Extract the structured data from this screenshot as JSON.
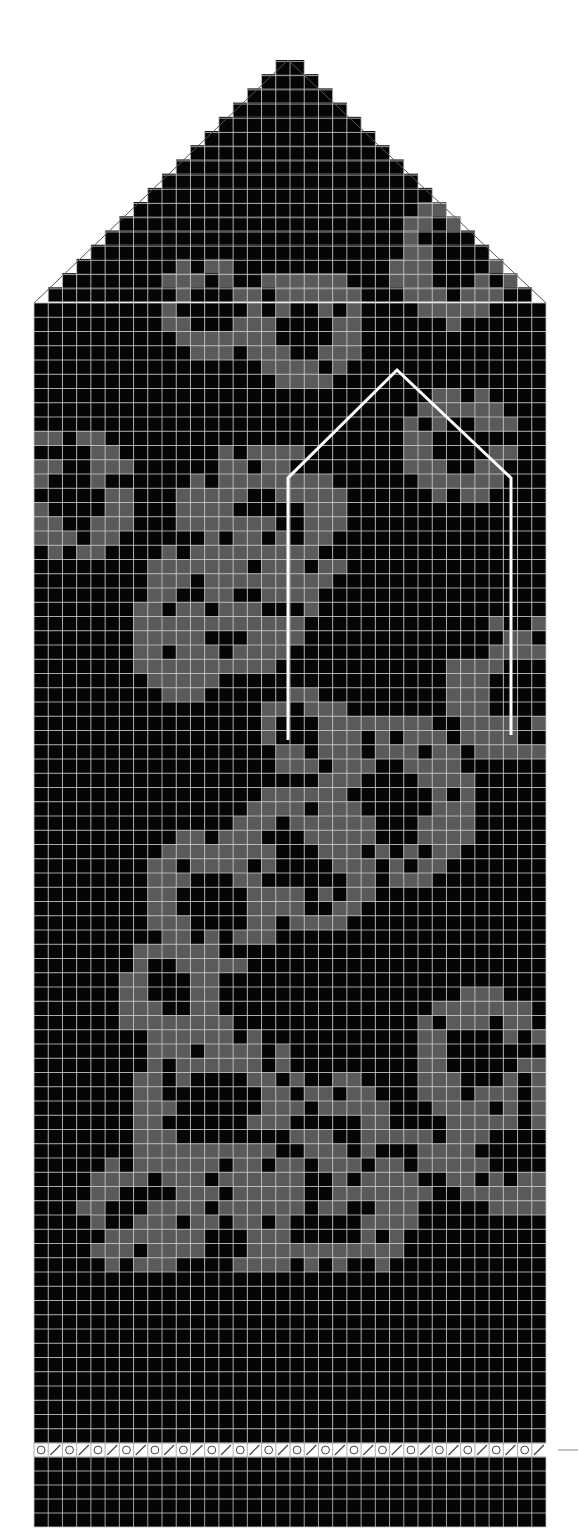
{
  "chart_data": {
    "type": "heatmap",
    "title": "",
    "columns": 36,
    "colors": {
      "background": "#ffffff",
      "dark": "#050505",
      "contrast": "#5a5a5a",
      "grid_line": "#c8c8c8",
      "thumb_outline": "#ffffff",
      "eyelet_row_fill": "#ffffff",
      "outline": "#555555"
    },
    "geometry": {
      "grid_left": 34,
      "grid_right": 546,
      "apex_x": 288,
      "apex_y": 60,
      "body_top": 303,
      "eyelet_row_top": 1443,
      "eyelet_row_bottom": 1457,
      "bottom": 1527,
      "tip_rows": 17
    },
    "thumb_outline_points": [
      [
        288,
        740
      ],
      [
        288,
        478
      ],
      [
        397,
        370
      ],
      [
        511,
        478
      ],
      [
        511,
        735
      ]
    ],
    "eyelet_row": {
      "symbols": [
        "yarn-over",
        "k2tog"
      ],
      "repeat_count": 18
    },
    "rib_rows_below_eyelet": 5,
    "marker_line": {
      "x1": 558,
      "x2": 578,
      "y": 1450
    },
    "pattern_seed": 7
  }
}
